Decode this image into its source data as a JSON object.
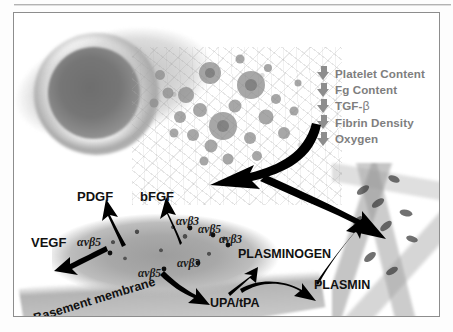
{
  "figure": {
    "title_present": false,
    "decrease_list": {
      "arrow_icon": "down-arrow-icon",
      "arrow_color": "#8d8d8d",
      "text_color": "#7e7e7e",
      "items": [
        {
          "label": "Platelet Content"
        },
        {
          "label": "Fg Content"
        },
        {
          "label": "TGF-",
          "greek": "β"
        },
        {
          "label": "Fibrin Density"
        },
        {
          "label": "Oxygen"
        }
      ]
    },
    "growth_factors": [
      {
        "name": "PDGF"
      },
      {
        "name": "bFGF"
      },
      {
        "name": "VEGF"
      }
    ],
    "proteases": [
      {
        "name": "UPA/tPA"
      },
      {
        "name": "PLASMINOGEN"
      },
      {
        "name": "PLASMIN"
      }
    ],
    "integrins": [
      {
        "name": "αvβ5"
      },
      {
        "name": "αvβ3"
      },
      {
        "name": "αvβ5"
      },
      {
        "name": "αvβ3"
      },
      {
        "name": "αvβ5"
      },
      {
        "name": "αvβ3"
      }
    ],
    "structures": [
      {
        "name": "Basement membrane"
      }
    ],
    "colors": {
      "frame": "#8d8d8d",
      "background": "#ffffff",
      "label_black": "#111111",
      "arrow_black": "#000000",
      "gray_text": "#7e7e7e"
    }
  }
}
